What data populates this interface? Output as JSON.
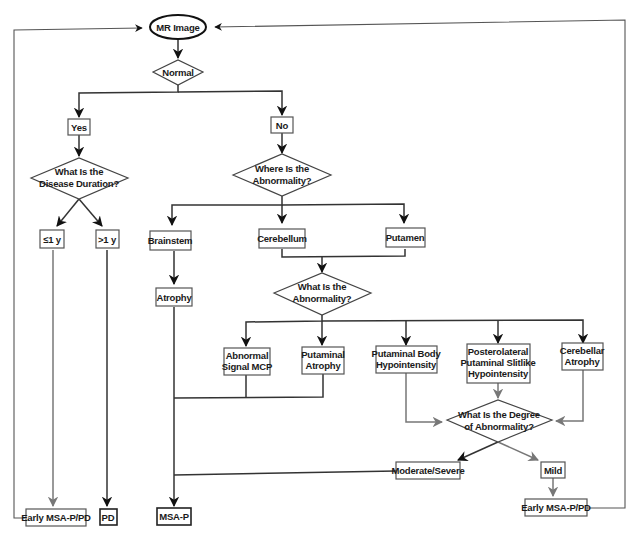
{
  "diagram": {
    "start": {
      "label": "MR Image"
    },
    "decisions": {
      "normal": {
        "label": "Normal"
      },
      "disease_duration": {
        "line1": "What Is the",
        "line2": "Disease Duration?"
      },
      "where_abnormality": {
        "line1": "Where Is the",
        "line2": "Abnormality?"
      },
      "what_abnormality": {
        "line1": "What Is the",
        "line2": "Abnormality?"
      },
      "degree_abnormality": {
        "line1": "What Is the Degree",
        "line2": "of Abnormality?"
      }
    },
    "nodes": {
      "yes": {
        "label": "Yes"
      },
      "no": {
        "label": "No"
      },
      "le1y": {
        "label": "≤1 y"
      },
      "gt1y": {
        "label": ">1 y"
      },
      "brainstem": {
        "label": "Brainstem"
      },
      "cerebellum": {
        "label": "Cerebellum"
      },
      "putamen": {
        "label": "Putamen"
      },
      "atrophy": {
        "label": "Atrophy"
      },
      "abnormal_signal_mcp": {
        "line1": "Abnormal",
        "line2": "Signal MCP"
      },
      "putaminal_atrophy": {
        "line1": "Putaminal",
        "line2": "Atrophy"
      },
      "putaminal_body_hypo": {
        "line1": "Putaminal Body",
        "line2": "Hypointensity"
      },
      "posterolateral": {
        "line1": "Posterolateral",
        "line2": "Putaminal Slitlike",
        "line3": "Hypointensity"
      },
      "cerebellar_atrophy": {
        "line1": "Cerebellar",
        "line2": "Atrophy"
      },
      "moderate_severe": {
        "label": "Moderate/Severe"
      },
      "mild": {
        "label": "Mild"
      }
    },
    "outcomes": {
      "early_msa_left": {
        "label": "Early MSA-P/PD"
      },
      "pd": {
        "label": "PD"
      },
      "msa_p": {
        "label": "MSA-P"
      },
      "early_msa_right": {
        "label": "Early MSA-P/PD"
      }
    },
    "colors": {
      "line": "#333333",
      "gray_arrow": "#777777",
      "box_border": "#555555",
      "background": "#ffffff"
    }
  }
}
